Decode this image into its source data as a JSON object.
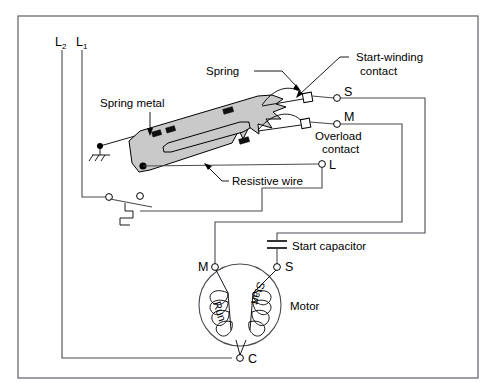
{
  "figure": {
    "type": "electrical-schematic"
  },
  "labels": {
    "line_l2": "L",
    "line_l2_sub": "2",
    "line_l1": "L",
    "line_l1_sub": "1",
    "spring_metal": "Spring metal",
    "spring": "Spring",
    "start_winding_contact_line1": "Start-winding",
    "start_winding_contact_line2": "contact",
    "overload_contact_line1": "Overload",
    "overload_contact_line2": "contact",
    "resistive_wire": "Resistive wire",
    "start_capacitor": "Start capacitor",
    "motor": "Motor",
    "run_winding": "Run",
    "start_winding": "Start"
  },
  "terminals": {
    "s_upper": "S",
    "m_upper": "M",
    "l_terminal": "L",
    "motor_m": "M",
    "motor_s": "S",
    "motor_c": "C"
  },
  "colors": {
    "wire": "#4a4a52",
    "frame": "#6b6b73",
    "bimetal_fill": "#c9c9c9",
    "clip": "#111111",
    "text": "#000000",
    "background": "#ffffff"
  }
}
